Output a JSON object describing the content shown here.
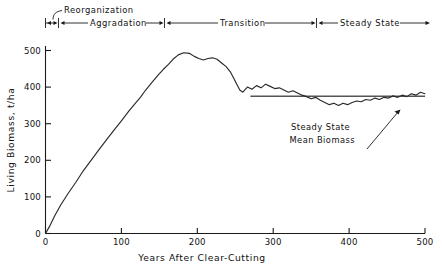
{
  "chart_data": {
    "type": "line",
    "title": "",
    "xlabel": "Years After Clear-Cutting",
    "ylabel": "Living Biomass, t/ha",
    "xlim": [
      0,
      500
    ],
    "ylim": [
      0,
      520
    ],
    "grid": false,
    "legend": "none",
    "xticks": [
      0,
      100,
      200,
      300,
      400,
      500
    ],
    "yticks": [
      0,
      100,
      200,
      300,
      400,
      500
    ],
    "xtick_labels": [
      "0",
      "100",
      "200",
      "300",
      "400",
      "500"
    ],
    "ytick_labels": [
      "0",
      "100",
      "200",
      "300",
      "400",
      "500"
    ],
    "series": [
      {
        "name": "Living Biomass",
        "x": [
          0,
          5,
          12,
          20,
          30,
          40,
          50,
          60,
          70,
          80,
          90,
          100,
          110,
          118,
          125,
          132,
          140,
          148,
          155,
          162,
          168,
          175,
          182,
          190,
          196,
          202,
          208,
          214,
          220,
          226,
          232,
          238,
          244,
          248,
          252,
          256,
          260,
          266,
          272,
          278,
          284,
          290,
          296,
          302,
          308,
          314,
          320,
          326,
          332,
          338,
          344,
          350,
          356,
          362,
          368,
          374,
          380,
          386,
          392,
          398,
          404,
          410,
          416,
          422,
          428,
          434,
          440,
          446,
          452,
          458,
          464,
          470,
          476,
          482,
          488,
          494,
          500
        ],
        "y": [
          0,
          18,
          48,
          78,
          110,
          140,
          172,
          200,
          228,
          255,
          282,
          308,
          335,
          355,
          372,
          392,
          412,
          432,
          448,
          462,
          476,
          488,
          494,
          492,
          484,
          478,
          474,
          478,
          480,
          476,
          466,
          456,
          440,
          424,
          408,
          392,
          386,
          400,
          394,
          404,
          398,
          408,
          402,
          396,
          398,
          392,
          386,
          390,
          384,
          378,
          374,
          368,
          372,
          364,
          358,
          352,
          356,
          350,
          356,
          352,
          358,
          362,
          360,
          366,
          364,
          370,
          366,
          372,
          370,
          376,
          372,
          378,
          374,
          382,
          378,
          386,
          382
        ]
      }
    ],
    "reference_lines": [
      {
        "name": "steady-state-mean-biomass",
        "orientation": "horizontal",
        "value": 375,
        "x_start": 270,
        "x_end": 500,
        "label": "Steady State Mean Biomass"
      }
    ],
    "peak": {
      "x": 175,
      "y": 494
    }
  },
  "axes": {
    "y_title": "Living Biomass, t/ha",
    "x_title": "Years After Clear-Cutting",
    "y_ticks": [
      "500",
      "400",
      "300",
      "200",
      "100",
      "0"
    ],
    "x_ticks": [
      "0",
      "100",
      "200",
      "300",
      "400",
      "500"
    ],
    "origin_label": "0"
  },
  "phases": {
    "reorganization": {
      "label": "Reorganization"
    },
    "aggradation": {
      "label": "Aggradation"
    },
    "transition": {
      "label": "Transition"
    },
    "steady_state": {
      "label": "Steady State"
    }
  },
  "annotation": {
    "line1": "Steady State",
    "line2": "Mean Biomass"
  },
  "colors": {
    "curve": "#2a2a2a",
    "axis": "#1a1a1a",
    "mean_line": "#555555",
    "background": "#ffffff"
  }
}
